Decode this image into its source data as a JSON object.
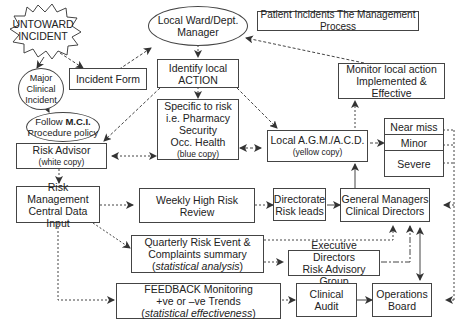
{
  "diagram": {
    "title": "Patient Incidents The Management Process",
    "nodes": {
      "untoward": {
        "line1": "UNTOWARD",
        "line2": "INCIDENT"
      },
      "major": {
        "line1": "Major",
        "line2": "Clinical",
        "line3": "Incident"
      },
      "incident_form": {
        "label": "Incident Form"
      },
      "follow_mci": {
        "pre": "Follow ",
        "bold": "M.C.I.",
        "line2": "Procedure policy"
      },
      "ward_manager": {
        "line1": "Local Ward/Dept.",
        "line2": "Manager"
      },
      "identify_action": {
        "line1": "Identify local",
        "line2": "ACTION"
      },
      "specific_risk": {
        "line1": "Specific to risk",
        "line2": "i.e. Pharmacy",
        "line3": "Security",
        "line4": "Occ. Health",
        "note": "(blue copy)"
      },
      "monitor": {
        "line1": "Monitor local action",
        "line2": "Implemented & Effective"
      },
      "risk_advisor": {
        "line1": "Risk Advisor",
        "note": "(white copy)"
      },
      "local_agm": {
        "line1": "Local A.G.M./A.C.D.",
        "note": "(yellow copy)"
      },
      "severity": {
        "items": [
          "Near miss",
          "Minor",
          "Severe"
        ]
      },
      "rm_central": {
        "line1": "Risk Management",
        "line2": "Central Data Input"
      },
      "weekly": {
        "line1": "Weekly High Risk",
        "line2": "Review"
      },
      "directorate": {
        "line1": "Directorate",
        "line2": "Risk leads"
      },
      "gm_cd": {
        "line1": "General Managers",
        "line2": "Clinical Directors"
      },
      "quarterly": {
        "line1": "Quarterly Risk Event &",
        "line2": "Complaints summary",
        "line3_open": "(",
        "line3_it": "statistical analysis",
        "line3_close": ")"
      },
      "exec": {
        "line1": "Executive Directors",
        "line2": "Risk Advisory Group"
      },
      "feedback": {
        "line1": "FEEDBACK Monitoring",
        "line2": "+ve or –ve Trends",
        "line3_open": "(",
        "line3_it": "statistical effectiveness",
        "line3_close": ")"
      },
      "clinical_audit": {
        "line1": "Clinical",
        "line2": "Audit"
      },
      "ops_board": {
        "line1": "Operations",
        "line2": "Board"
      }
    },
    "colors": {
      "line": "#444444",
      "background": "#ffffff",
      "text": "#222222"
    }
  }
}
